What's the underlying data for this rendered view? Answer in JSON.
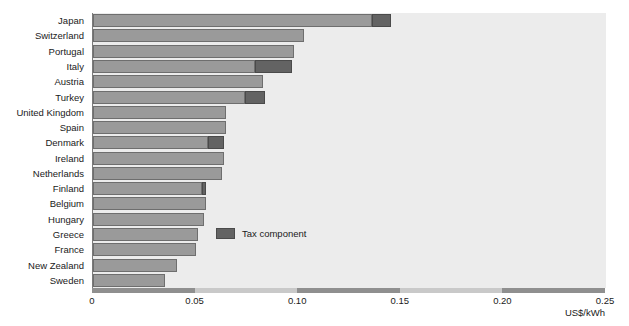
{
  "chart_data": {
    "type": "bar",
    "orientation": "horizontal",
    "stacked": true,
    "title": "",
    "subtitle": "",
    "xlabel": "US$/kWh",
    "ylabel": "",
    "xlim": [
      0,
      0.25
    ],
    "xticks": [
      "0",
      "0.05",
      "0.10",
      "0.15",
      "0.20",
      "0.25"
    ],
    "xtick_values": [
      0,
      0.05,
      0.1,
      0.15,
      0.2,
      0.25
    ],
    "grid": false,
    "legend": [
      {
        "label": "Tax component",
        "color": "#636363"
      }
    ],
    "legend_position": "center-right-inside",
    "series": [
      {
        "name": "Price excluding tax",
        "color": "#9a9a9a"
      },
      {
        "name": "Tax component",
        "color": "#636363"
      }
    ],
    "categories": [
      "Japan",
      "Switzerland",
      "Portugal",
      "Italy",
      "Austria",
      "Turkey",
      "United Kingdom",
      "Spain",
      "Denmark",
      "Ireland",
      "Netherlands",
      "Finland",
      "Belgium",
      "Hungary",
      "Greece",
      "France",
      "New Zealand",
      "Sweden"
    ],
    "bars": [
      {
        "category": "Japan",
        "base": 0.136,
        "tax": 0.009,
        "total": 0.145
      },
      {
        "category": "Switzerland",
        "base": 0.103,
        "tax": 0.0,
        "total": 0.103
      },
      {
        "category": "Portugal",
        "base": 0.098,
        "tax": 0.0,
        "total": 0.098
      },
      {
        "category": "Italy",
        "base": 0.079,
        "tax": 0.018,
        "total": 0.097
      },
      {
        "category": "Austria",
        "base": 0.083,
        "tax": 0.0,
        "total": 0.083
      },
      {
        "category": "Turkey",
        "base": 0.074,
        "tax": 0.01,
        "total": 0.084
      },
      {
        "category": "United Kingdom",
        "base": 0.065,
        "tax": 0.0,
        "total": 0.065
      },
      {
        "category": "Spain",
        "base": 0.065,
        "tax": 0.0,
        "total": 0.065
      },
      {
        "category": "Denmark",
        "base": 0.056,
        "tax": 0.008,
        "total": 0.064
      },
      {
        "category": "Ireland",
        "base": 0.064,
        "tax": 0.0,
        "total": 0.064
      },
      {
        "category": "Netherlands",
        "base": 0.063,
        "tax": 0.0,
        "total": 0.063
      },
      {
        "category": "Finland",
        "base": 0.053,
        "tax": 0.002,
        "total": 0.055
      },
      {
        "category": "Belgium",
        "base": 0.055,
        "tax": 0.0,
        "total": 0.055
      },
      {
        "category": "Hungary",
        "base": 0.054,
        "tax": 0.0,
        "total": 0.054
      },
      {
        "category": "Greece",
        "base": 0.051,
        "tax": 0.0,
        "total": 0.051
      },
      {
        "category": "France",
        "base": 0.05,
        "tax": 0.0,
        "total": 0.05
      },
      {
        "category": "New Zealand",
        "base": 0.041,
        "tax": 0.0,
        "total": 0.041
      },
      {
        "category": "Sweden",
        "base": 0.035,
        "tax": 0.0,
        "total": 0.035
      }
    ],
    "colors": {
      "plot_background": "#ececec",
      "bar_fill": "#9a9a9a",
      "bar_edge": "#6e6e6e",
      "tax_fill": "#636363",
      "tax_edge": "#4a4a4a",
      "axis_track": "#c9c9c9",
      "axis_segment": "#8f8f8f",
      "text": "#1a1a1a",
      "page_background": "#ffffff"
    },
    "axis_segments": [
      {
        "from": 0.0,
        "to": 0.05
      },
      {
        "from": 0.1,
        "to": 0.15
      },
      {
        "from": 0.2,
        "to": 0.25
      }
    ]
  }
}
